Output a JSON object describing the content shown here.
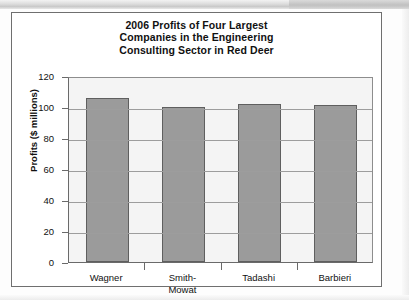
{
  "figure": {
    "title_lines": [
      "2006 Profits of Four Largest",
      "Companies in the Engineering",
      "Consulting Sector in Red Deer"
    ],
    "bar_color": "#9b9b9b",
    "bar_border_color": "#5f5f5f",
    "grid_color": "#9d9d9d",
    "axis_color": "#6a6a6a",
    "plot_background": "#f4f4f4",
    "card_border_color": "#6f6f6f"
  },
  "chart_data": {
    "type": "bar",
    "categories": [
      "Wagner",
      "Smith-Mowat",
      "Tadashi",
      "Barbieri"
    ],
    "category_label_lines": [
      [
        "Wagner"
      ],
      [
        "Smith-",
        "Mowat"
      ],
      [
        "Tadashi"
      ],
      [
        "Barbieri"
      ]
    ],
    "values": [
      106,
      100,
      102,
      101
    ],
    "xlabel": "",
    "ylabel": "Profits ($ millions)",
    "ylim": [
      0,
      120
    ],
    "yticks": [
      0,
      20,
      40,
      60,
      80,
      100,
      120
    ],
    "ytick_labels": [
      "0",
      "20",
      "40",
      "60",
      "80",
      "100",
      "120"
    ],
    "grid": true,
    "grid_axis": "y",
    "legend": false
  }
}
